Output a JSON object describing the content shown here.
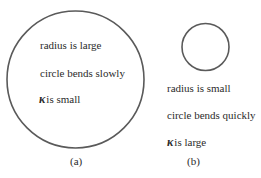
{
  "panels": [
    {
      "id": "a",
      "caption": "(a)",
      "circle": {
        "cx": 75.5,
        "cy": 79.5,
        "r": 68.5,
        "stroke": "#5a5a5a"
      },
      "lines": [
        {
          "text": "radius is large"
        },
        {
          "text": "circle bends slowly"
        },
        {
          "symbol": "κ",
          "text": "is small"
        }
      ]
    },
    {
      "id": "b",
      "caption": "(b)",
      "circle": {
        "cx": 205.5,
        "cy": 47,
        "r": 23.5,
        "stroke": "#5a5a5a"
      },
      "lines": [
        {
          "text": "radius is small"
        },
        {
          "text": "circle bends quickly"
        },
        {
          "symbol": "κ",
          "text": "is large"
        }
      ]
    }
  ]
}
